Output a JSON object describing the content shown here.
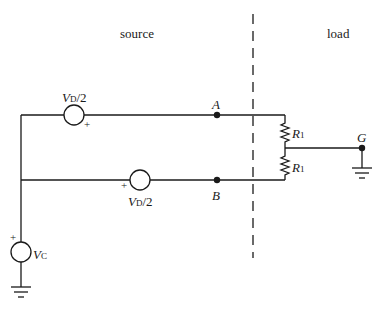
{
  "regions": {
    "source": "source",
    "load": "load"
  },
  "sources": {
    "top": {
      "symbol": "V",
      "subscript": "D",
      "suffix": "/2",
      "polarity": "+"
    },
    "bottom": {
      "symbol": "V",
      "subscript": "D",
      "suffix": "/2",
      "polarity": "+"
    },
    "common": {
      "symbol": "V",
      "subscript": "C",
      "polarity": "+"
    }
  },
  "nodes": {
    "a": "A",
    "b": "B",
    "g": "G"
  },
  "resistors": {
    "top": {
      "symbol": "R",
      "subscript": "1"
    },
    "bottom": {
      "symbol": "R",
      "subscript": "1"
    }
  },
  "colors": {
    "ink": "#1a1a1a",
    "background": "#ffffff"
  }
}
